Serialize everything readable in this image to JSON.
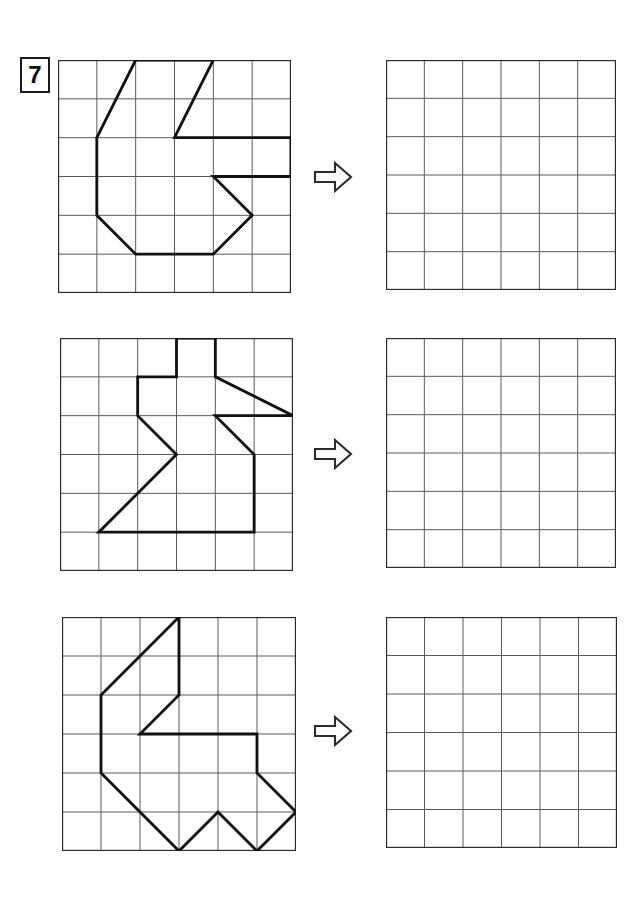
{
  "worksheet": {
    "exercise_number": "7",
    "grid_columns": 6,
    "grid_rows": 6,
    "grid_line_color": "#5a5a5a",
    "grid_border_color": "#2b2b2b",
    "figure_stroke_color": "#111111",
    "arrow_icon": "arrow-right-outline",
    "arrow_stroke_color": "#2b2b2b",
    "background_color": "#ffffff"
  },
  "rows": [
    {
      "index": 1,
      "source_label": "source-grid-1",
      "answer_label": "answer-grid-1",
      "arrow_label": "arrow-1",
      "figure": {
        "name": "figure-1",
        "closed": true,
        "points": [
          [
            2,
            0
          ],
          [
            4,
            0
          ],
          [
            3,
            2
          ],
          [
            6,
            2
          ],
          [
            6,
            3
          ],
          [
            4,
            3
          ],
          [
            5,
            4
          ],
          [
            4,
            5
          ],
          [
            2,
            5
          ],
          [
            1,
            4
          ],
          [
            1,
            2
          ]
        ]
      }
    },
    {
      "index": 2,
      "source_label": "source-grid-2",
      "answer_label": "answer-grid-2",
      "arrow_label": "arrow-2",
      "figure": {
        "name": "figure-2",
        "closed": true,
        "points": [
          [
            3,
            0
          ],
          [
            4,
            0
          ],
          [
            4,
            1
          ],
          [
            6,
            2
          ],
          [
            4,
            2
          ],
          [
            5,
            3
          ],
          [
            5,
            5
          ],
          [
            1,
            5
          ],
          [
            3,
            3
          ],
          [
            2,
            2
          ],
          [
            2,
            1
          ],
          [
            3,
            1
          ]
        ]
      }
    },
    {
      "index": 3,
      "source_label": "source-grid-3",
      "answer_label": "answer-grid-3",
      "arrow_label": "arrow-3",
      "figure": {
        "name": "figure-3",
        "closed": true,
        "points": [
          [
            3,
            0
          ],
          [
            1,
            2
          ],
          [
            1,
            4
          ],
          [
            2,
            5
          ],
          [
            3,
            6
          ],
          [
            4,
            5
          ],
          [
            5,
            6
          ],
          [
            6,
            5
          ],
          [
            5,
            4
          ],
          [
            5,
            3
          ],
          [
            2,
            3
          ],
          [
            3,
            2
          ],
          [
            3,
            0
          ]
        ]
      }
    }
  ],
  "geometry": {
    "source_grid_x": [
      58,
      60,
      62
    ],
    "source_grid_y": [
      60,
      338,
      617
    ],
    "source_grid_size": [
      233,
      233,
      234
    ],
    "answer_grid_x": [
      386,
      386,
      386
    ],
    "answer_grid_y": [
      60,
      338,
      617
    ],
    "answer_grid_size": [
      230,
      230,
      231
    ],
    "arrow_x": [
      313,
      313,
      313
    ],
    "arrow_y": [
      160,
      437,
      714
    ]
  }
}
